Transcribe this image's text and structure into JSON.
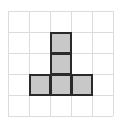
{
  "diagram": {
    "type": "grid-polyomino",
    "grid": {
      "origin_x": 8,
      "origin_y": 11,
      "cell_size": 21,
      "cols": 5,
      "rows": 5,
      "line_color": "#dcdcdc"
    },
    "shape": {
      "name": "T-pentomino (inverted T / tall)",
      "fill_color": "#c8c8c8",
      "border_color": "#2a2a2a",
      "cells": [
        {
          "col": 2,
          "row": 1
        },
        {
          "col": 2,
          "row": 2
        },
        {
          "col": 1,
          "row": 3
        },
        {
          "col": 2,
          "row": 3
        },
        {
          "col": 3,
          "row": 3
        }
      ]
    }
  }
}
